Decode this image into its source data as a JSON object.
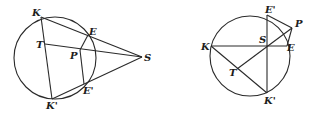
{
  "figures": [
    {
      "id": "left",
      "circle": {
        "cx": 55,
        "cy": 58,
        "r": 41
      },
      "points": {
        "K": {
          "x": 41,
          "y": 17,
          "label": "K",
          "lx": 32,
          "ly": 16
        },
        "E": {
          "x": 88,
          "y": 35,
          "label": "E",
          "lx": 89,
          "ly": 35
        },
        "T": {
          "x": 45,
          "y": 44,
          "label": "T",
          "lx": 36,
          "ly": 48
        },
        "P": {
          "x": 80,
          "y": 50,
          "label": "P",
          "lx": 70,
          "ly": 59
        },
        "S": {
          "x": 142,
          "y": 57,
          "label": "S",
          "lx": 144,
          "ly": 61
        },
        "E'": {
          "x": 84,
          "y": 84,
          "label": "E'",
          "lx": 83,
          "ly": 94
        },
        "K'": {
          "x": 52,
          "y": 99,
          "label": "K'",
          "lx": 46,
          "ly": 109
        }
      },
      "segments": [
        [
          "K",
          "S"
        ],
        [
          "T",
          "S"
        ],
        [
          "K'",
          "S"
        ],
        [
          "K",
          "K'"
        ],
        [
          "E",
          "P"
        ],
        [
          "P",
          "E'"
        ]
      ]
    },
    {
      "id": "right",
      "circle": {
        "cx": 250,
        "cy": 56,
        "r": 40
      },
      "points": {
        "K": {
          "x": 211,
          "y": 46,
          "label": "K",
          "lx": 201,
          "ly": 50
        },
        "S": {
          "x": 267,
          "y": 46,
          "label": "S",
          "lx": 259,
          "ly": 43
        },
        "E": {
          "x": 287,
          "y": 46,
          "label": "E",
          "lx": 287,
          "ly": 51
        },
        "E'": {
          "x": 267,
          "y": 15,
          "label": "E'",
          "lx": 265,
          "ly": 13
        },
        "P": {
          "x": 292,
          "y": 28,
          "label": "P",
          "lx": 295,
          "ly": 27
        },
        "T": {
          "x": 237,
          "y": 69,
          "label": "T",
          "lx": 229,
          "ly": 76
        },
        "K'": {
          "x": 267,
          "y": 93,
          "label": "K'",
          "lx": 264,
          "ly": 104
        }
      },
      "segments": [
        [
          "K",
          "E"
        ],
        [
          "E'",
          "K'"
        ],
        [
          "K",
          "K'"
        ],
        [
          "E'",
          "P"
        ],
        [
          "P",
          "E"
        ],
        [
          "T",
          "P"
        ]
      ]
    }
  ]
}
